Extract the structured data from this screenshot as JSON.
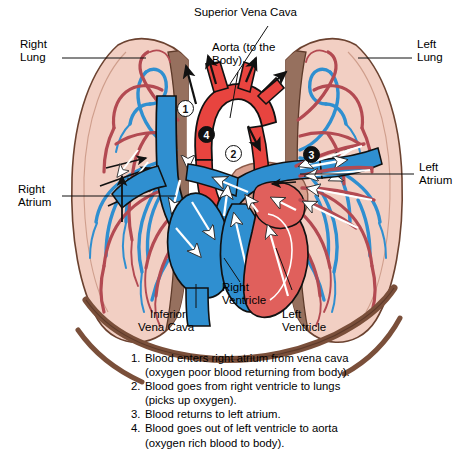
{
  "figure": {
    "type": "anatomical-diagram"
  },
  "labels": {
    "superior_vena_cava": "Superior Vena Cava",
    "aorta_line1": "Aorta (to the",
    "aorta_line2": "Body)",
    "right_lung_line1": "Right",
    "right_lung_line2": "Lung",
    "left_lung_line1": "Left",
    "left_lung_line2": "Lung",
    "right_atrium_line1": "Right",
    "right_atrium_line2": "Atrium",
    "left_atrium_line1": "Left",
    "left_atrium_line2": "Atrium",
    "inferior_vena_cava_line1": "Inferior",
    "inferior_vena_cava_line2": "Vena Cava",
    "right_ventricle_line1": "Right",
    "right_ventricle_line2": "Ventricle",
    "left_ventricle_line1": "Left",
    "left_ventricle_line2": "Ventricle"
  },
  "badges": [
    {
      "id": "1",
      "label": "1",
      "style": "white"
    },
    {
      "id": "2",
      "label": "2",
      "style": "white"
    },
    {
      "id": "3",
      "label": "3",
      "style": "black"
    },
    {
      "id": "4",
      "label": "4",
      "style": "black"
    }
  ],
  "caption": {
    "steps": [
      {
        "number": "1.",
        "text": "Blood enters right atrium from vena cava",
        "sub": "(oxygen poor blood returning from body)."
      },
      {
        "number": "2.",
        "text": "Blood goes from right ventricle to lungs",
        "sub": "(picks up oxygen)."
      },
      {
        "number": "3.",
        "text": "Blood returns to left atrium.",
        "sub": ""
      },
      {
        "number": "4.",
        "text": "Blood goes out of left ventricle to aorta",
        "sub": "(oxygen rich blood to body)."
      }
    ]
  },
  "colors": {
    "background": "#ffffff",
    "lung_tissue": "#f2cfc3",
    "lung_outline": "#6b4230",
    "mediastinum": "#96705e",
    "diaphragm": "#7a4f3a",
    "artery_red": "#e8443f",
    "vein_blue": "#2f8fd0",
    "dark_red_vessel": "#b34a52",
    "heart_muscle_red": "#e0605c",
    "white_arrow": "#ffffff",
    "outline": "#1a1a1a",
    "text": "#000000"
  }
}
